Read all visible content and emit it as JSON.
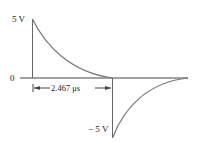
{
  "diagram": {
    "type": "waveform",
    "labels": {
      "top": "5 V",
      "zero": "0",
      "bottom": "− 5 V",
      "interval": "2.467 μs"
    },
    "colors": {
      "axis": "#444444",
      "curve": "#777777"
    }
  }
}
